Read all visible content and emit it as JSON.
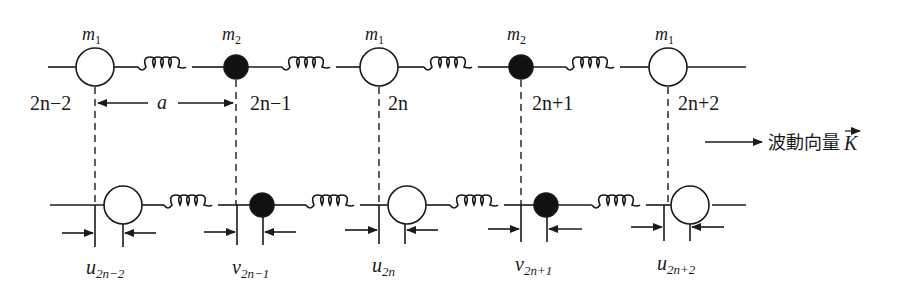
{
  "diagram": {
    "colors": {
      "line": "#1a1a1a",
      "heavy_mass_fill": "#ffffff",
      "light_mass_fill": "#111111",
      "background": "#ffffff"
    },
    "top_chain": {
      "masses": [
        {
          "label": "m",
          "sub": "1",
          "index_label": "2n−2",
          "type": "open"
        },
        {
          "label": "m",
          "sub": "2",
          "index_label": "2n−1",
          "type": "filled"
        },
        {
          "label": "m",
          "sub": "1",
          "index_label": "2n",
          "type": "open"
        },
        {
          "label": "m",
          "sub": "2",
          "index_label": "2n+1",
          "type": "filled"
        },
        {
          "label": "m",
          "sub": "1",
          "index_label": "2n+2",
          "type": "open"
        }
      ],
      "spacing_label": "a"
    },
    "wave_vector": {
      "text": "波動向量",
      "symbol": "K"
    },
    "bottom_chain": {
      "displacements": [
        {
          "symbol": "u",
          "sub": "2n−2"
        },
        {
          "symbol": "v",
          "sub": "2n−1"
        },
        {
          "symbol": "u",
          "sub": "2n"
        },
        {
          "symbol": "v",
          "sub": "2n+1"
        },
        {
          "symbol": "u",
          "sub": "2n+2"
        }
      ]
    }
  }
}
